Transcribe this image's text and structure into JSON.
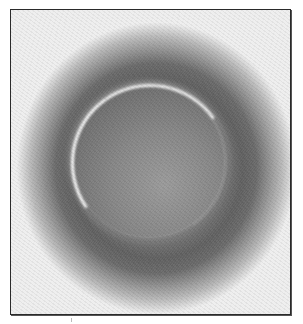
{
  "image": {
    "description": "Grayscale photograph of a bright luminous ring (circular arc) against a dark noisy halo, enclosed in a thin black frame",
    "subject": "ring",
    "colors": {
      "frame": "#2a2a2a",
      "background": "#ffffff",
      "halo_dark": "#606060",
      "ring_highlight": "#ffffff"
    }
  }
}
